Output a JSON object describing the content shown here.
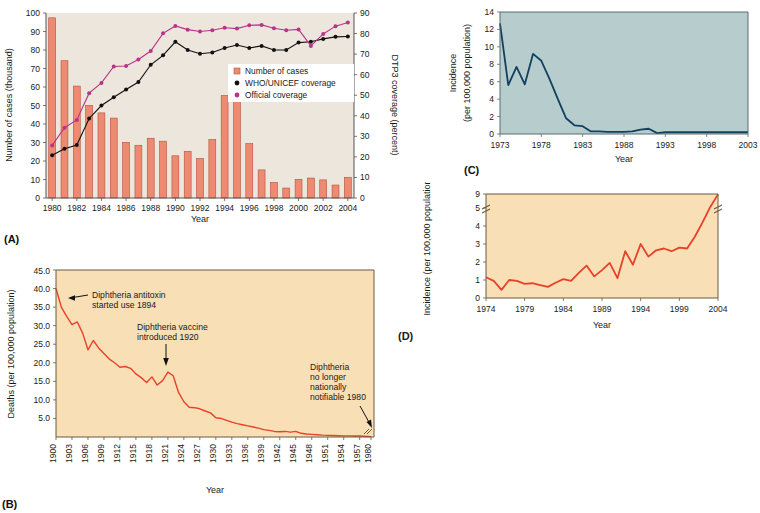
{
  "figure": {
    "panels": [
      "(A)",
      "(B)",
      "(C)",
      "(D)"
    ]
  },
  "panelA": {
    "id": "(A)",
    "plot_bg": "#EDE6DC",
    "bar_color": "#EE8A72",
    "bar_edge": "#B5523B",
    "who_color": "#111111",
    "official_color": "#B8338A",
    "xlabel": "Year",
    "ylabel_left": "Number of cases (thousand)",
    "ylabel_right": "DTP3 coverage (percent)",
    "yticks_left": [
      "0",
      "10",
      "20",
      "30",
      "40",
      "50",
      "60",
      "70",
      "80",
      "90",
      "100"
    ],
    "yticks_right": [
      "0",
      "10",
      "20",
      "30",
      "40",
      "50",
      "60",
      "70",
      "80",
      "90"
    ],
    "xticks": [
      "1980",
      "1982",
      "1984",
      "1986",
      "1988",
      "1990",
      "1992",
      "1994",
      "1996",
      "1998",
      "2000",
      "2002",
      "2004"
    ],
    "legend": [
      {
        "label": "Number of cases",
        "marker": "square",
        "color": "#EE8A72"
      },
      {
        "label": "WHO/UNICEF coverage",
        "marker": "dot",
        "color": "#111111"
      },
      {
        "label": "Official coverage",
        "marker": "dot",
        "color": "#B8338A"
      }
    ]
  },
  "panelB": {
    "id": "(B)",
    "plot_bg": "#F8DFB5",
    "line_color": "#E8412A",
    "xlabel": "Year",
    "ylabel": "Deaths (per 100,000 population)",
    "yticks": [
      "5.0",
      "10.0",
      "15.0",
      "20.0",
      "25.0",
      "30.0",
      "35.0",
      "40.0",
      "45.0"
    ],
    "xticks": [
      "1900",
      "1903",
      "1906",
      "1909",
      "1912",
      "1915",
      "1918",
      "1921",
      "1924",
      "1927",
      "1930",
      "1933",
      "1936",
      "1939",
      "1942",
      "1945",
      "1948",
      "1951",
      "1954",
      "1957",
      "1980"
    ],
    "annotations": [
      {
        "text": "Diphtheria antitoxin\nstarted use 1894"
      },
      {
        "text": "Diphtheria vaccine\nintroduced 1920"
      },
      {
        "text": "Diphtheria\nno longer\nnationally\nnotifiable 1980"
      }
    ]
  },
  "panelC": {
    "id": "(C)",
    "plot_bg": "#B7CCCD",
    "line_color": "#12415F",
    "xlabel": "Year",
    "ylabel": "Incidence\n(per 100,000 population)",
    "yticks": [
      "0",
      "2",
      "4",
      "6",
      "8",
      "10",
      "12",
      "14"
    ],
    "xticks": [
      "1973",
      "1978",
      "1983",
      "1988",
      "1993",
      "1998",
      "2003"
    ]
  },
  "panelD": {
    "id": "(D)",
    "plot_bg": "#F8DFB5",
    "line_color": "#E8412A",
    "xlabel": "Year",
    "ylabel": "Incidence (per 100,000 population)",
    "yticks": [
      "0",
      "1",
      "2",
      "3",
      "4",
      "5",
      "9"
    ],
    "xticks": [
      "1974",
      "1979",
      "1984",
      "1989",
      "1994",
      "1999",
      "2004"
    ],
    "axis_break": true
  },
  "chart_data": [
    {
      "panel": "A",
      "type": "bar",
      "title": "",
      "xlabel": "Year",
      "ylabel": "Number of cases (thousand)",
      "ylabel2": "DTP3 coverage (percent)",
      "ylim": [
        0,
        100
      ],
      "ylim2": [
        0,
        90
      ],
      "grid": false,
      "legend_position": "center-right",
      "categories": [
        1980,
        1981,
        1982,
        1983,
        1984,
        1985,
        1986,
        1987,
        1988,
        1989,
        1990,
        1991,
        1992,
        1993,
        1994,
        1995,
        1996,
        1997,
        1998,
        1999,
        2000,
        2001,
        2002,
        2003,
        2004
      ],
      "values": [
        97.4,
        74.2,
        60.5,
        50.1,
        46.0,
        43.2,
        30.1,
        28.5,
        32.3,
        30.7,
        22.8,
        25.2,
        21.4,
        31.6,
        55.4,
        57.5,
        29.4,
        15.2,
        8.4,
        5.4,
        10.1,
        10.8,
        9.8,
        7.0,
        11.2
      ],
      "series": [
        {
          "name": "Number of cases",
          "axis": "left",
          "values": [
            97.4,
            74.2,
            60.5,
            50.1,
            46.0,
            43.2,
            30.1,
            28.5,
            32.3,
            30.7,
            22.8,
            25.2,
            21.4,
            31.6,
            55.4,
            57.5,
            29.4,
            15.2,
            8.4,
            5.4,
            10.1,
            10.8,
            9.8,
            7.0,
            11.2
          ]
        },
        {
          "name": "WHO/UNICEF coverage",
          "axis": "right",
          "values": [
            20.8,
            24.0,
            25.8,
            38.7,
            45.0,
            49.0,
            52.8,
            56.4,
            64.8,
            69.4,
            76.0,
            72.0,
            70.2,
            70.8,
            73.0,
            74.4,
            73.0,
            74.0,
            72.0,
            72.0,
            75.6,
            76.0,
            77.4,
            78.4,
            78.6
          ]
        },
        {
          "name": "Official coverage",
          "axis": "right",
          "values": [
            25.6,
            34.2,
            38.0,
            51.0,
            56.0,
            64.0,
            64.2,
            67.4,
            71.5,
            80.1,
            83.7,
            81.9,
            81.0,
            81.6,
            82.8,
            82.4,
            84.0,
            84.2,
            82.6,
            81.6,
            82.0,
            74.0,
            79.8,
            83.6,
            85.4
          ]
        }
      ]
    },
    {
      "panel": "B",
      "type": "line",
      "title": "",
      "xlabel": "Year",
      "ylabel": "Deaths (per 100,000 population)",
      "ylim": [
        0,
        45
      ],
      "grid": false,
      "x": [
        1900,
        1901,
        1902,
        1903,
        1904,
        1905,
        1906,
        1907,
        1908,
        1909,
        1910,
        1911,
        1912,
        1913,
        1914,
        1915,
        1916,
        1917,
        1918,
        1919,
        1920,
        1921,
        1922,
        1923,
        1924,
        1925,
        1926,
        1927,
        1928,
        1929,
        1930,
        1931,
        1932,
        1933,
        1934,
        1935,
        1936,
        1937,
        1938,
        1939,
        1940,
        1941,
        1942,
        1943,
        1944,
        1945,
        1946,
        1947,
        1948,
        1949,
        1950,
        1951,
        1952,
        1953,
        1954,
        1955,
        1956,
        1957,
        1980
      ],
      "values": [
        40.0,
        35.0,
        32.5,
        30.3,
        31.0,
        28.0,
        23.5,
        26.0,
        24.0,
        22.5,
        21.0,
        20.0,
        18.8,
        19.0,
        18.5,
        17.0,
        16.0,
        14.7,
        16.2,
        14.0,
        15.2,
        17.5,
        16.5,
        12.0,
        9.5,
        8.0,
        7.9,
        7.6,
        7.0,
        6.5,
        5.2,
        5.0,
        4.5,
        4.0,
        3.6,
        3.3,
        3.0,
        2.7,
        2.4,
        2.0,
        1.8,
        1.5,
        1.4,
        1.5,
        1.3,
        1.5,
        1.0,
        0.8,
        0.7,
        0.6,
        0.5,
        0.45,
        0.4,
        0.35,
        0.3,
        0.3,
        0.25,
        0.25,
        0.1
      ],
      "annotations": [
        {
          "text": "Diphtheria antitoxin started use 1894",
          "points_to_year": 1901,
          "points_to_value": 35.0
        },
        {
          "text": "Diphtheria vaccine introduced 1920",
          "points_to_year": 1920,
          "points_to_value": 15.2
        },
        {
          "text": "Diphtheria no longer nationally notifiable 1980",
          "points_to_year": 1980,
          "points_to_value": 0.1
        }
      ]
    },
    {
      "panel": "C",
      "type": "area",
      "title": "",
      "xlabel": "Year",
      "ylabel": "Incidence (per 100,000 population)",
      "ylim": [
        0,
        14
      ],
      "grid": false,
      "x": [
        1973,
        1974,
        1975,
        1976,
        1977,
        1978,
        1979,
        1980,
        1981,
        1982,
        1983,
        1984,
        1985,
        1986,
        1987,
        1988,
        1989,
        1990,
        1991,
        1992,
        1993,
        1994,
        1995,
        1996,
        1997,
        1998,
        1999,
        2000,
        2001,
        2002,
        2003
      ],
      "values": [
        12.7,
        5.6,
        7.7,
        5.7,
        9.2,
        8.4,
        6.3,
        4.0,
        1.8,
        1.0,
        0.9,
        0.3,
        0.3,
        0.25,
        0.25,
        0.25,
        0.3,
        0.5,
        0.6,
        0.1,
        0.2,
        0.2,
        0.2,
        0.2,
        0.2,
        0.2,
        0.2,
        0.2,
        0.2,
        0.2,
        0.2
      ]
    },
    {
      "panel": "D",
      "type": "area",
      "title": "",
      "xlabel": "Year",
      "ylabel": "Incidence (per 100,000 population)",
      "ylim": [
        0,
        9
      ],
      "grid": false,
      "axis_break_between": [
        5,
        9
      ],
      "x": [
        1974,
        1975,
        1976,
        1977,
        1978,
        1979,
        1980,
        1981,
        1982,
        1983,
        1984,
        1985,
        1986,
        1987,
        1988,
        1989,
        1990,
        1991,
        1992,
        1993,
        1994,
        1995,
        1996,
        1997,
        1998,
        1999,
        2000,
        2001,
        2002,
        2003,
        2004
      ],
      "values": [
        1.15,
        0.95,
        0.45,
        1.0,
        0.95,
        0.78,
        0.82,
        0.72,
        0.62,
        0.85,
        1.05,
        0.95,
        1.4,
        1.8,
        1.2,
        1.55,
        1.95,
        1.1,
        2.6,
        1.85,
        3.0,
        2.3,
        2.65,
        2.75,
        2.6,
        2.8,
        2.75,
        3.4,
        4.2,
        5.3,
        8.9
      ]
    }
  ]
}
